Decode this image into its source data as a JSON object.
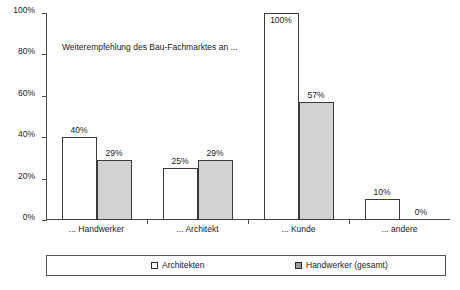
{
  "chart_data": {
    "type": "bar",
    "title": "",
    "subtitle": "",
    "annotation": "Weiterempfehlung des Bau-Fachmarktes an ...",
    "categories": [
      "... Handwerker",
      "... Architekt",
      "... Kunde",
      "... andere"
    ],
    "series": [
      {
        "name": "Architekten",
        "values": [
          40,
          25,
          100,
          10
        ],
        "labels": [
          "40%",
          "25%",
          "100%",
          "10%"
        ],
        "color": "#ffffff"
      },
      {
        "name": "Handwerker (gesamt)",
        "values": [
          29,
          29,
          57,
          0
        ],
        "labels": [
          "29%",
          "29%",
          "57%",
          "0%"
        ],
        "color": "#d2d2d2"
      }
    ],
    "xlabel": "",
    "ylabel": "",
    "ylim": [
      0,
      100
    ],
    "yticks": [
      0,
      20,
      40,
      60,
      80,
      100
    ],
    "ytick_labels": [
      "0%",
      "20%",
      "40%",
      "60%",
      "80%",
      "100%"
    ],
    "grid": false,
    "legend_position": "bottom",
    "units": "percent",
    "colors": {
      "series_architekten": "#ffffff",
      "series_handwerker": "#d2d2d2",
      "bar_outline": "#3a3a3a",
      "axis": "#4a4a4a",
      "text": "#1a1a1a",
      "legend_border": "#555555",
      "background": "#ffffff"
    }
  },
  "legend": {
    "entries": [
      {
        "label": "Architekten"
      },
      {
        "label": "Handwerker (gesamt)"
      }
    ]
  }
}
